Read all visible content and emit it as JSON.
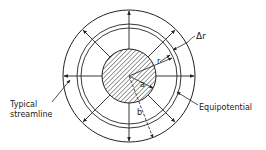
{
  "diagram": {
    "labels": {
      "delta_r": "Δr",
      "r": "r",
      "a": "a",
      "b": "b",
      "typical_streamline_line1": "Typical",
      "typical_streamline_line2": "streamline",
      "equipotential": "Equipotential"
    },
    "colors": {
      "stroke": "#222222",
      "background": "#ffffff"
    },
    "radial_streamline_angles_deg": [
      0,
      45,
      90,
      135,
      180,
      225,
      270,
      315
    ]
  }
}
